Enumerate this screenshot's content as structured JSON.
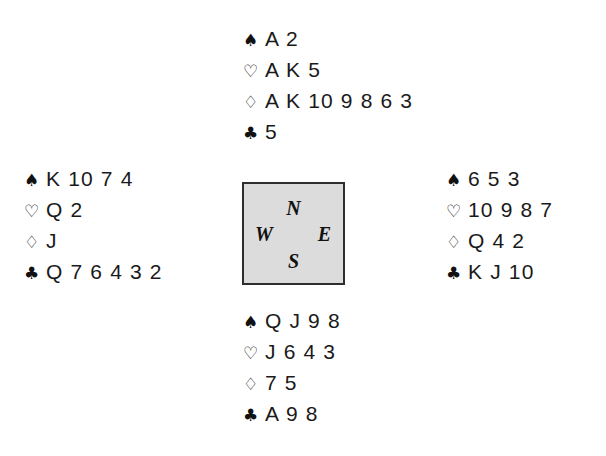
{
  "diagram": {
    "background_color": "#ffffff",
    "text_color": "#111111"
  },
  "suits": {
    "spades": {
      "name": "spade-suit-symbol",
      "glyph": "♠",
      "fill": "filled"
    },
    "hearts": {
      "name": "heart-suit-symbol",
      "glyph": "♡",
      "fill": "hollow"
    },
    "diamonds": {
      "name": "diamond-suit-symbol",
      "glyph": "♢",
      "fill": "hollow"
    },
    "clubs": {
      "name": "club-suit-symbol",
      "glyph": "♣",
      "fill": "filled"
    }
  },
  "compass": {
    "box_fill": "#dcdcdc",
    "box_border": "#2e2e2e",
    "north": "N",
    "east": "E",
    "south": "S",
    "west": "W"
  },
  "hands": {
    "north": {
      "label": "North",
      "spades": "A 2",
      "hearts": "A K 5",
      "diamonds": "A K 10 9 8 6 3",
      "clubs": "5"
    },
    "west": {
      "label": "West",
      "spades": "K 10 7 4",
      "hearts": "Q 2",
      "diamonds": "J",
      "clubs": "Q 7 6 4 3 2"
    },
    "east": {
      "label": "East",
      "spades": "6 5 3",
      "hearts": "10 9 8 7",
      "diamonds": "Q 4 2",
      "clubs": "K J 10"
    },
    "south": {
      "label": "South",
      "spades": "Q J 9 8",
      "hearts": "J 6 4 3",
      "diamonds": "7 5",
      "clubs": "A 9 8"
    }
  }
}
